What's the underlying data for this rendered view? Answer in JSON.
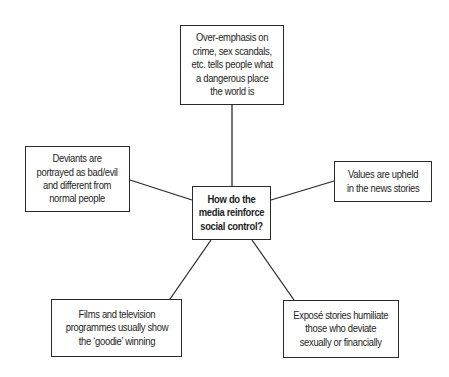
{
  "diagram": {
    "type": "spider-diagram",
    "center": {
      "label": "How do the media reinforce social control?",
      "lines": [
        "How do the",
        "media reinforce",
        "social control?"
      ]
    },
    "nodes": [
      {
        "id": "top",
        "label": "Over-emphasis on crime, sex scandals, etc. tells people what a dangerous place the world is",
        "lines": [
          "Over-emphasis on",
          "crime, sex scandals,",
          "etc. tells people what",
          "a dangerous place",
          "the world is"
        ]
      },
      {
        "id": "left",
        "label": "Deviants are portrayed as bad/evil and different from normal people",
        "lines": [
          "Deviants are",
          "portrayed as bad/evil",
          "and different from",
          "normal people"
        ]
      },
      {
        "id": "right",
        "label": "Values are upheld in the news stories",
        "lines": [
          "Values are upheld",
          "in the news stories"
        ]
      },
      {
        "id": "bottom-left",
        "label": "Films and television programmes usually show the 'goodie' winning",
        "lines": [
          "Films and television",
          "programmes usually show",
          "the ‘goodie’ winning"
        ]
      },
      {
        "id": "bottom-right",
        "label": "Exposé stories humiliate those who deviate sexually or financially",
        "lines": [
          "Exposé stories humiliate",
          "those who deviate",
          "sexually or financially"
        ]
      }
    ],
    "edges": [
      {
        "from": "center",
        "to": "top"
      },
      {
        "from": "center",
        "to": "left"
      },
      {
        "from": "center",
        "to": "right"
      },
      {
        "from": "center",
        "to": "bottom-left"
      },
      {
        "from": "center",
        "to": "bottom-right"
      }
    ],
    "colors": {
      "line": "#2a2a2a",
      "text": "#1e1e1e",
      "background": "#ffffff"
    }
  }
}
